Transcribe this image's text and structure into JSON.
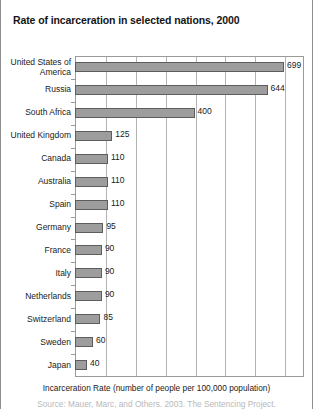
{
  "chart_data": {
    "type": "bar",
    "orientation": "horizontal",
    "title": "Rate of incarceration in selected nations, 2000",
    "xlabel": "Incarceration Rate (number of people per 100,000 population)",
    "ylabel": "",
    "categories": [
      "United States of America",
      "Russia",
      "South Africa",
      "United Kingdom",
      "Canada",
      "Australia",
      "Spain",
      "Germany",
      "France",
      "Italy",
      "Netherlands",
      "Switzerland",
      "Sweden",
      "Japan"
    ],
    "values": [
      699,
      644,
      400,
      125,
      110,
      110,
      110,
      95,
      90,
      90,
      90,
      85,
      60,
      40
    ],
    "xlim": [
      0,
      766
    ],
    "gridline_interval": 100,
    "gridlines": [
      100,
      200,
      300,
      400,
      500,
      600,
      700
    ],
    "grid": true,
    "legend": false,
    "bar_color": "#9d9d9d",
    "bar_border_color": "#5d5d5d",
    "axis_color": "#9a9a9a",
    "gridline_color": "#b4b4b4",
    "data_labels_shown": true
  },
  "source_note": "Source: Mauer, Marc, and Others. 2003. The Sentencing Project."
}
